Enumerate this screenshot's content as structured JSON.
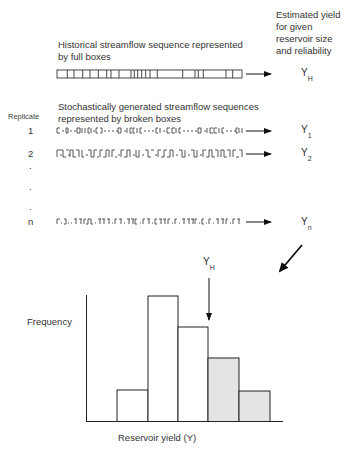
{
  "header": {
    "estimated_yield_lines": [
      "Estimated yield",
      "for given",
      "reservoir size",
      "and reliability"
    ]
  },
  "historical": {
    "caption_lines": [
      "Historical streamflow sequence represented",
      "by full boxes"
    ],
    "yield_symbol": "Y",
    "yield_subscript": "H"
  },
  "stochastic": {
    "caption_lines": [
      "Stochastically generated streamflow sequences",
      "represented by broken boxes"
    ],
    "replicate_label": "Replicate",
    "rows": [
      {
        "label": "1",
        "yield_symbol": "Y",
        "yield_subscript": "1"
      },
      {
        "label": "2",
        "yield_symbol": "Y",
        "yield_subscript": "2"
      },
      {
        "label": "n",
        "yield_symbol": "Y",
        "yield_subscript": "n"
      }
    ],
    "ellipsis_dots": [
      ".",
      ".",
      "."
    ]
  },
  "histogram": {
    "ylabel": "Frequency",
    "xlabel": "Reservoir yield (Y)",
    "marker_symbol": "Y",
    "marker_subscript": "H",
    "bars": [
      {
        "relative_height": 0.25,
        "shaded": false
      },
      {
        "relative_height": 1.0,
        "shaded": false
      },
      {
        "relative_height": 0.75,
        "shaded": false
      },
      {
        "relative_height": 0.5,
        "shaded": true
      },
      {
        "relative_height": 0.24,
        "shaded": true
      }
    ],
    "shade_color": "#e4e4e4",
    "line_color": "#222222"
  }
}
